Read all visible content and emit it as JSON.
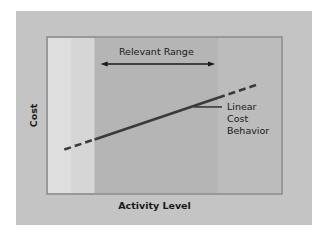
{
  "chart_data": {
    "type": "line",
    "title": "",
    "xlabel": "Activity Level",
    "ylabel": "Cost",
    "grid": false,
    "legend": "none",
    "x_range": [
      0,
      100
    ],
    "y_range": [
      0,
      100
    ],
    "relevant_range": {
      "label": "Relevant Range",
      "x_start": 20,
      "x_end": 73
    },
    "series": [
      {
        "name": "Linear Cost Behavior",
        "points": [
          {
            "x": 7,
            "y": 28
          },
          {
            "x": 90,
            "y": 70
          }
        ],
        "solid_within_relevant_range": true,
        "dashed_outside_relevant_range": true
      }
    ],
    "annotations": [
      {
        "text_lines": [
          "Linear",
          "Cost",
          "Behavior"
        ],
        "points_to": "series-line",
        "position": "right"
      }
    ]
  },
  "colors": {
    "page_background": "#ffffff",
    "panel_background": "#c4c4c4",
    "plot_left_region": "#d6d6d6",
    "plot_middle_region": "#b5b5b5",
    "plot_right_region": "#bcbcbc",
    "border": "#8a8a8a",
    "line": "#3a3a3a",
    "text": "#1a1a1a"
  }
}
